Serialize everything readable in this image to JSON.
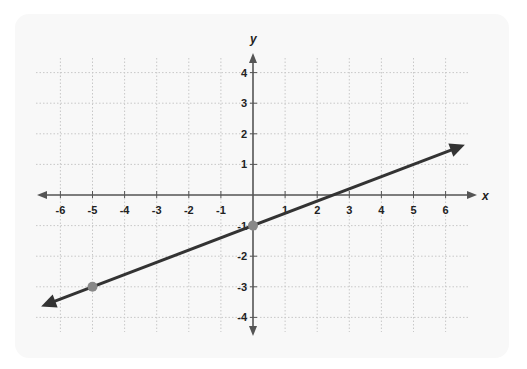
{
  "chart_data": {
    "type": "line",
    "title": "",
    "xlabel": "x",
    "ylabel": "y",
    "xlim": [
      -6,
      6
    ],
    "ylim": [
      -4,
      4
    ],
    "grid": true,
    "x_ticks": [
      -6,
      -5,
      -4,
      -3,
      -2,
      -1,
      1,
      2,
      3,
      4,
      5,
      6
    ],
    "y_ticks": [
      4,
      3,
      2,
      1,
      -1,
      -2,
      -3,
      -4
    ],
    "series": [
      {
        "name": "line",
        "equation": "y = 0.4x - 1",
        "slope": 0.4,
        "intercept": -1,
        "arrows": "both",
        "points": [
          {
            "x": -5,
            "y": -3
          },
          {
            "x": 0,
            "y": -1
          }
        ],
        "line_color": "#333333",
        "point_color": "#888888"
      }
    ]
  },
  "axes": {
    "x_label": "x",
    "y_label": "y",
    "x_tick_labels": [
      "-6",
      "-5",
      "-4",
      "-3",
      "-2",
      "-1",
      "1",
      "2",
      "3",
      "4",
      "5",
      "6"
    ],
    "y_tick_labels": [
      "4",
      "3",
      "2",
      "1",
      "-1",
      "-2",
      "-3",
      "-4"
    ]
  },
  "colors": {
    "axis": "#555555",
    "grid": "#c8c8c8",
    "line": "#333333",
    "point": "#8a8a8a",
    "card": "#f8f8f8"
  }
}
